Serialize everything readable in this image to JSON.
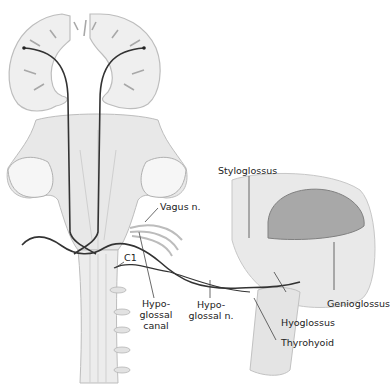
{
  "figure": {
    "labels": {
      "styloglossus": "Styloglossus",
      "vagus": "Vagus n.",
      "c1": "C1",
      "hypoglossal_canal": [
        "Hypo-",
        "glossal",
        "canal"
      ],
      "hypoglossal_nerve": [
        "Hypo-",
        "glossal n."
      ],
      "hyoglossus": "Hyoglossus",
      "genioglossus": "Genioglossus",
      "thyrohyoid": "Thyrohyoid"
    },
    "colors": {
      "tissue": "#e6e6e6",
      "tissue_dark": "#b8b8b8",
      "nerve": "#333333",
      "leader": "#444444",
      "tongue": "#9a9a9a"
    }
  }
}
